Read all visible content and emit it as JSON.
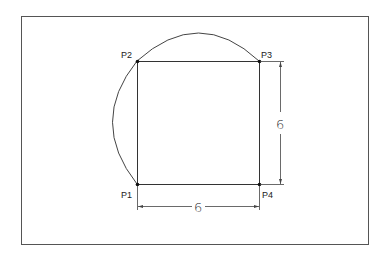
{
  "diagram": {
    "points": {
      "p1": {
        "label": "P1",
        "x": 137,
        "y": 184
      },
      "p2": {
        "label": "P2",
        "x": 137,
        "y": 61
      },
      "p3": {
        "label": "P3",
        "x": 259,
        "y": 61
      },
      "p4": {
        "label": "P4",
        "x": 259,
        "y": 184
      }
    },
    "dimensions": {
      "horizontal": "6",
      "vertical": "6"
    },
    "colors": {
      "stroke": "#333333",
      "frame": "#555555",
      "background": "#ffffff"
    }
  }
}
